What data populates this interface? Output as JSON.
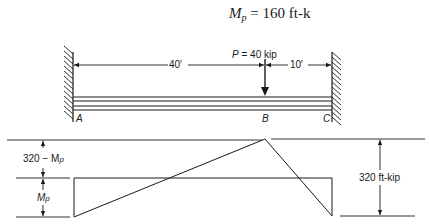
{
  "title": {
    "symbol": "M",
    "subscript": "p",
    "equals": "=",
    "value": "160 ft-k"
  },
  "beam": {
    "load_label": "P = 40 kip",
    "load_symbol": "P",
    "load_value": "= 40 kip",
    "dim_left": "40′",
    "dim_right": "10′",
    "point_a": "A",
    "point_b": "B",
    "point_c": "C",
    "supports": [
      "fixed-left",
      "fixed-right"
    ]
  },
  "moment_diagram": {
    "label_upper": "320 − M",
    "label_upper_sub": "p",
    "label_lower": "M",
    "label_lower_sub": "p",
    "label_total": "320 ft-kip"
  },
  "colors": {
    "ink": "#1a1a1a",
    "background": "#ffffff"
  }
}
